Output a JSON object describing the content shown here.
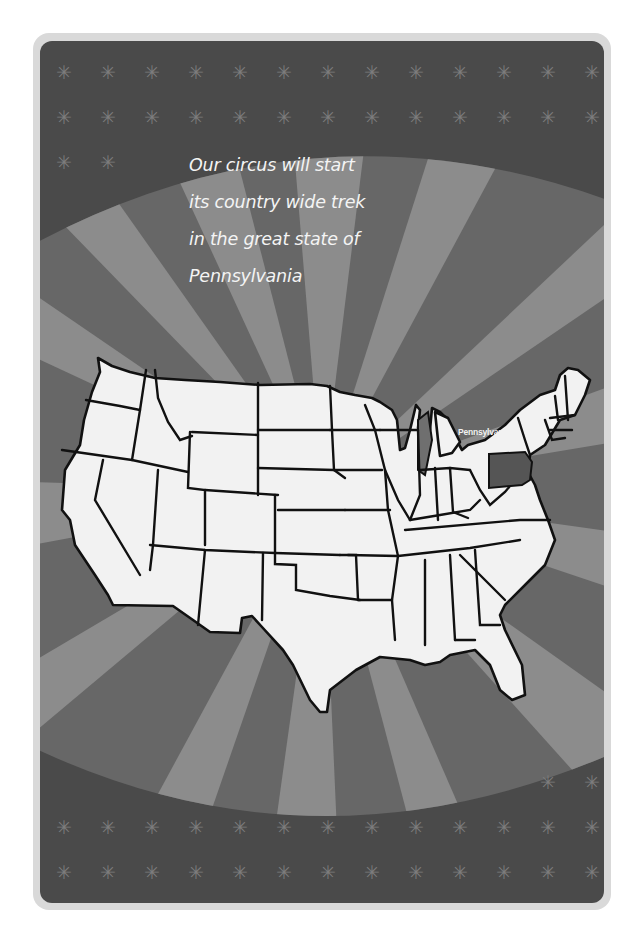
{
  "poster": {
    "headline_lines": [
      "Our circus will start",
      "its country wide trek",
      "in the great state of",
      "Pennsylvania"
    ],
    "highlighted_state_label": "Pennsylvania",
    "decoration_icon": "asterisk-star-icon",
    "star_glyph": "✳"
  },
  "colors": {
    "page_background": "#ffffff",
    "card_border": "#d9d9d9",
    "card_background": "#4a4a4a",
    "ray_dark": "#676767",
    "ray_light": "#8c8c8c",
    "star": "#7c7c7c",
    "map_fill": "#f2f2f2",
    "map_outline": "#111111",
    "highlight_state": "#555555",
    "text": "#f4f4f4"
  }
}
